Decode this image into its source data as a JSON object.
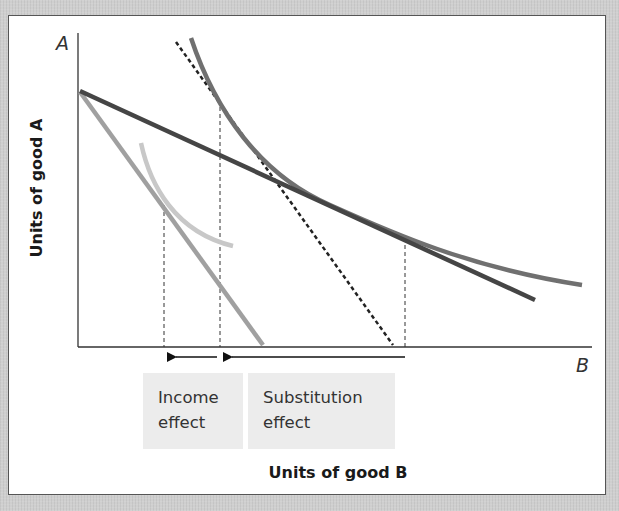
{
  "diagram": {
    "y_axis_letter": "A",
    "x_axis_letter": "B",
    "y_axis_label": "Units of good A",
    "x_axis_label": "Units of good B",
    "labels": {
      "income_effect": [
        "Income",
        "effect"
      ],
      "substitution_effect": [
        "Substitution",
        "effect"
      ]
    },
    "elements": [
      {
        "id": "original-budget-line",
        "kind": "line",
        "style": "solid",
        "color": "#9a9a9a",
        "description": "Budget line after price rise (steeper, light gray)"
      },
      {
        "id": "new-budget-line",
        "kind": "line",
        "style": "solid",
        "color": "#4a4a4a",
        "description": "Initial budget line (flatter, dark)"
      },
      {
        "id": "compensated-budget-line",
        "kind": "line",
        "style": "dashed",
        "color": "#222222",
        "description": "Compensated budget line parallel to steeper line, tangent to higher curve"
      },
      {
        "id": "higher-indifference-curve",
        "kind": "curve",
        "color": "#6e6e6e"
      },
      {
        "id": "lower-indifference-curve",
        "kind": "curve",
        "color": "#c4c4c4"
      },
      {
        "id": "income-effect-arrow",
        "kind": "arrow",
        "direction": "left"
      },
      {
        "id": "substitution-effect-arrow",
        "kind": "arrow",
        "direction": "left"
      }
    ],
    "colors": {
      "background": "#cfcfcf",
      "panel": "#ffffff",
      "label_box": "#ececec",
      "axis": "#333333",
      "text": "#1a1a1a"
    }
  }
}
